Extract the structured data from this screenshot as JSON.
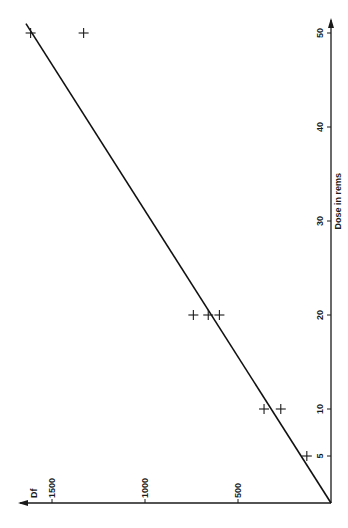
{
  "chart_data": {
    "type": "scatter",
    "orientation": "rotated-90-ccw",
    "title": "",
    "xlabel": "Dose in rems",
    "ylabel": "Df",
    "xlim": [
      0,
      50
    ],
    "ylim": [
      0,
      1500
    ],
    "x_ticks": [
      5,
      10,
      20,
      30,
      40,
      50
    ],
    "x_tick_labels": [
      "5",
      "10",
      "20",
      "30",
      "40",
      "50"
    ],
    "y_ticks": [
      500,
      1000,
      1500
    ],
    "y_tick_labels": [
      "500",
      "1000",
      "1500"
    ],
    "grid": false,
    "legend": "none",
    "series": [
      {
        "name": "measured",
        "marker": "plus",
        "points": [
          {
            "x": 5,
            "y": 130
          },
          {
            "x": 10,
            "y": 360
          },
          {
            "x": 10,
            "y": 270
          },
          {
            "x": 20,
            "y": 740
          },
          {
            "x": 20,
            "y": 660
          },
          {
            "x": 20,
            "y": 600
          },
          {
            "x": 50,
            "y": 1615
          },
          {
            "x": 50,
            "y": 1330
          }
        ]
      },
      {
        "name": "fit",
        "type": "line",
        "points": [
          {
            "x": 0,
            "y": 0
          },
          {
            "x": 51,
            "y": 1640
          }
        ]
      }
    ]
  }
}
